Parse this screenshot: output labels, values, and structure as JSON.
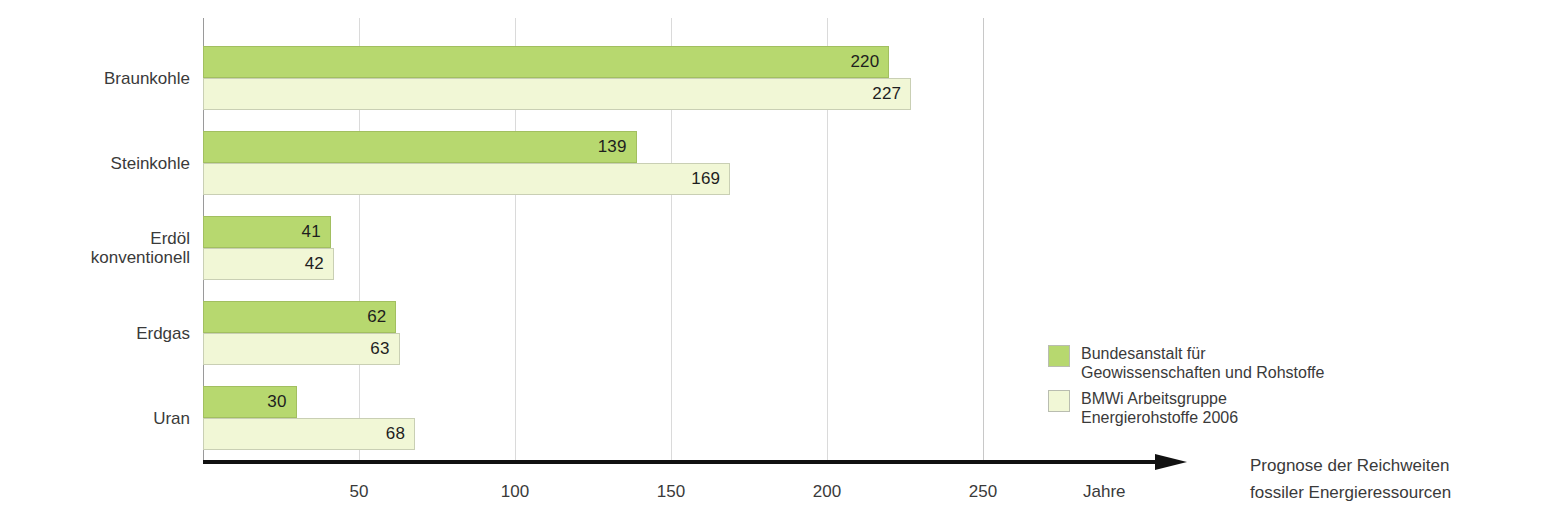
{
  "chart_data": {
    "type": "bar",
    "orientation": "horizontal",
    "title": "",
    "xlabel": "Jahre",
    "ylabel": "",
    "xlim": [
      0,
      250
    ],
    "xticks": [
      50,
      100,
      150,
      200,
      250
    ],
    "grid": true,
    "legend_position": "right",
    "categories": [
      "Braunkohle",
      "Steinkohle",
      "Erdöl\nkonventionell",
      "Erdgas",
      "Uran"
    ],
    "series": [
      {
        "name": "Bundesanstalt für\nGeowissenschaften und Rohstoffe",
        "color": "#b7d86f",
        "values": [
          220,
          139,
          41,
          62,
          30
        ]
      },
      {
        "name": "BMWi Arbeitsgruppe\nEnergierohstoffe 2006",
        "color": "#f1f7d6",
        "values": [
          227,
          169,
          42,
          63,
          68
        ]
      }
    ]
  },
  "axis": {
    "unit_label": "Jahre",
    "tick_labels": [
      "50",
      "100",
      "150",
      "200",
      "250"
    ]
  },
  "legend": {
    "items": [
      {
        "label": "Bundesanstalt für\nGeowissenschaften und Rohstoffe",
        "color": "#b7d86f"
      },
      {
        "label": "BMWi Arbeitsgruppe\nEnergierohstoffe 2006",
        "color": "#f1f7d6"
      }
    ]
  },
  "caption": {
    "text": "Prognose der Reichweiten\nfossiler Energieressourcen"
  }
}
